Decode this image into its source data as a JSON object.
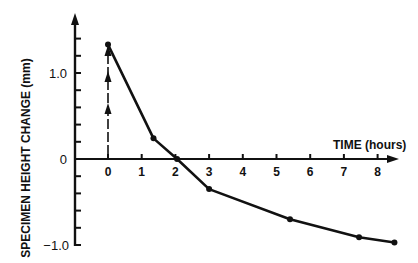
{
  "chart_data": {
    "type": "line",
    "title": "",
    "xlabel": "TIME (hours)",
    "ylabel": "SPECIMEN HEIGHT CHANGE (mm)",
    "x_ticks": [
      "0",
      "1",
      "2",
      "3",
      "4",
      "5",
      "6",
      "7",
      "8"
    ],
    "y_tick_labels": [
      "1.0",
      "0",
      "−1.0"
    ],
    "y_minor_tick_step": 0.2,
    "xlim": [
      -0.9,
      8.7
    ],
    "ylim": [
      -1.0,
      1.7
    ],
    "grid": false,
    "legend": null,
    "series": [
      {
        "name": "height change",
        "x": [
          0,
          1.35,
          2.05,
          3.0,
          5.4,
          7.45,
          8.5
        ],
        "y": [
          1.33,
          0.24,
          0.0,
          -0.35,
          -0.7,
          -0.91,
          -0.97
        ],
        "markers": true
      }
    ],
    "annotations": [
      {
        "type": "vertical-dashed-arrows",
        "x": 0,
        "y_from": 0,
        "y_to": 1.33,
        "arrow_count": 3,
        "meaning": "instantaneous load application"
      }
    ]
  },
  "axes": {
    "xlabel": "TIME (hours)",
    "ylabel": "SPECIMEN HEIGHT CHANGE (mm)",
    "x_ticks": [
      "0",
      "1",
      "2",
      "3",
      "4",
      "5",
      "6",
      "7",
      "8"
    ],
    "y_labels": {
      "top": "1.0",
      "zero": "0",
      "bottom": "−1.0"
    }
  }
}
